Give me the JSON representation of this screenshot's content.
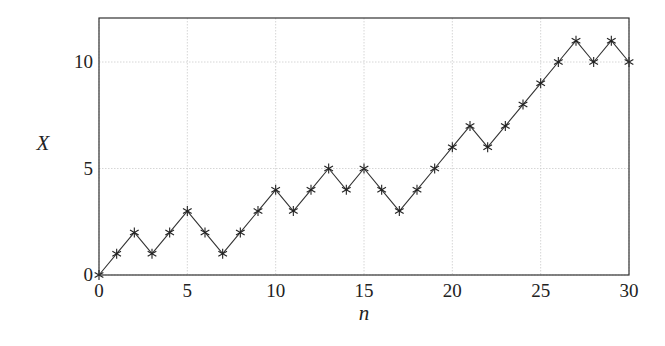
{
  "chart_data": {
    "type": "line",
    "title": "",
    "xlabel": "n",
    "ylabel": "X",
    "x": [
      0,
      1,
      2,
      3,
      4,
      5,
      6,
      7,
      8,
      9,
      10,
      11,
      12,
      13,
      14,
      15,
      16,
      17,
      18,
      19,
      20,
      21,
      22,
      23,
      24,
      25,
      26,
      27,
      28,
      29,
      30
    ],
    "series": [
      {
        "name": "X",
        "marker": "asterisk",
        "values": [
          0,
          1,
          2,
          1,
          2,
          3,
          2,
          1,
          2,
          3,
          4,
          3,
          4,
          5,
          4,
          5,
          4,
          3,
          4,
          5,
          6,
          7,
          6,
          7,
          8,
          9,
          10,
          11,
          10,
          11,
          10
        ]
      }
    ],
    "xlim": [
      0,
      30
    ],
    "ylim": [
      0,
      12
    ],
    "xticks": [
      "0",
      "5",
      "10",
      "15",
      "20",
      "25",
      "30"
    ],
    "yticks": [
      "0",
      "5",
      "10"
    ],
    "grid": true,
    "legend": null
  },
  "colors": {
    "line": "#333333",
    "grid": "#cccccc",
    "axis": "#333333"
  }
}
